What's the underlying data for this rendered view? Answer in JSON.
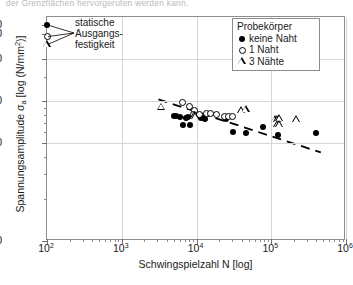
{
  "top_caption": "der Grenzflächen hervorgerufen werden kann.",
  "chart_data": {
    "type": "scatter",
    "title": "",
    "xlabel": "Schwingspielzahl N [log]",
    "ylabel_parts": {
      "text_a": "Spannungsamplitude σ",
      "sub": "a",
      "text_b": " [log (N/mm",
      "sup": "2",
      "text_c": ")]"
    },
    "ylabel": "Spannungsamplitude σa [log (N/mm2)]",
    "xscale": "log",
    "yscale": "log",
    "xlim": [
      100,
      1000000
    ],
    "ylim": [
      10,
      400
    ],
    "grid": true,
    "xticklabels": [
      "10",
      "10",
      "10",
      "10",
      "10"
    ],
    "xtick_exponents": [
      "2",
      "3",
      "4",
      "5",
      "6"
    ],
    "xtick_values": [
      100,
      1000,
      10000,
      100000,
      1000000
    ],
    "yticklabels": [
      "350",
      "300",
      "200",
      "100",
      "50",
      "10"
    ],
    "ytick_values": [
      350,
      300,
      200,
      100,
      50,
      10
    ],
    "annotation": {
      "line1": "statische",
      "line2": "Ausgangs-",
      "line3": "festigkeit"
    },
    "legend": {
      "position": "top-right",
      "title": "Probekörper",
      "entries": [
        {
          "symbol": "filled-circle",
          "label": "keine Naht"
        },
        {
          "symbol": "open-circle",
          "label": "1 Naht"
        },
        {
          "symbol": "open-triangle",
          "label": "3 Nähte"
        }
      ]
    },
    "trendline": {
      "style": "dashed",
      "x_start": 3100,
      "y_start": 103,
      "x_end": 460000,
      "y_end": 43
    },
    "series": [
      {
        "name": "keine Naht",
        "symbol": "filled-circle",
        "points": [
          [
            100,
            350
          ],
          [
            5000,
            78
          ],
          [
            5400,
            78
          ],
          [
            6000,
            77
          ],
          [
            6700,
            68
          ],
          [
            8200,
            68
          ],
          [
            7200,
            76
          ],
          [
            7600,
            77
          ],
          [
            11500,
            76
          ],
          [
            12500,
            76
          ],
          [
            13000,
            75
          ],
          [
            25000,
            75
          ],
          [
            31000,
            60
          ],
          [
            46000,
            59
          ],
          [
            78000,
            65
          ],
          [
            125000,
            57
          ],
          [
            400000,
            59
          ]
        ]
      },
      {
        "name": "1 Naht",
        "symbol": "open-circle",
        "points": [
          [
            100,
            290
          ],
          [
            6400,
            98
          ],
          [
            8100,
            92
          ],
          [
            9500,
            86
          ],
          [
            9000,
            80
          ],
          [
            11000,
            80
          ],
          [
            13500,
            82
          ],
          [
            15500,
            82
          ],
          [
            18500,
            80
          ],
          [
            24000,
            78
          ],
          [
            27000,
            78
          ],
          [
            30000,
            78
          ]
        ]
      },
      {
        "name": "3 Nähte",
        "symbol": "open-triangle",
        "points": [
          [
            100,
            255
          ],
          [
            3400,
            91
          ],
          [
            9300,
            79
          ],
          [
            9800,
            78
          ],
          [
            40000,
            86
          ],
          [
            46000,
            87
          ],
          [
            112000,
            74
          ],
          [
            122000,
            74
          ],
          [
            130000,
            75
          ],
          [
            120000,
            68
          ],
          [
            128000,
            68
          ],
          [
            215000,
            74
          ]
        ]
      }
    ]
  }
}
